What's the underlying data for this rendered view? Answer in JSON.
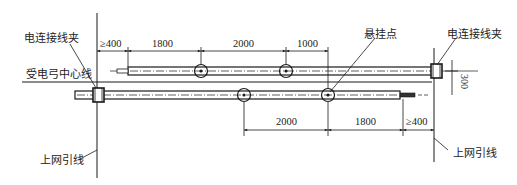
{
  "labels": {
    "clamp_left": "电连接线夹",
    "clamp_right": "电连接线夹",
    "suspension_point": "悬挂点",
    "pantograph_centerline": "受电弓中心线",
    "feeder_left": "上网引线",
    "feeder_right": "上网引线"
  },
  "dimensions": {
    "top": [
      "≥400",
      "1800",
      "2000",
      "1000"
    ],
    "bottom": [
      "2000",
      "1800",
      "≥400"
    ],
    "vertical_offset": "300"
  },
  "colors": {
    "line": "#1a1a1a",
    "background": "#ffffff"
  }
}
